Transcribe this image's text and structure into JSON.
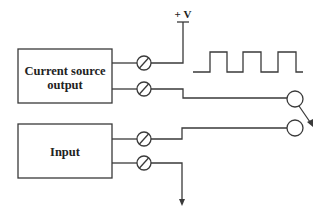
{
  "diagram": {
    "type": "circuit-schematic",
    "supply_label": "+ V",
    "blocks": [
      {
        "id": "current-source",
        "lines": [
          "Current source",
          "output"
        ]
      },
      {
        "id": "input",
        "lines": [
          "Input"
        ]
      }
    ],
    "terminals": 4,
    "waveform": "square-wave",
    "switch": "two-contact switch (open)",
    "ground": "arrow",
    "colors": {
      "line": "#3a3a3a",
      "text": "#222222",
      "background": "#ffffff"
    }
  }
}
